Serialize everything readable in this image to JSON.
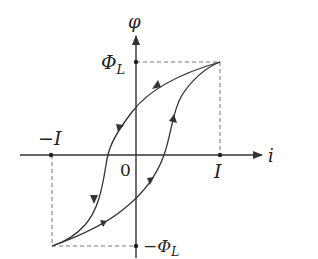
{
  "axes": {
    "x_label": "i",
    "y_label": "φ",
    "origin_label": "0"
  },
  "marks": {
    "phi_L": "Φ",
    "phi_L_sub": "L",
    "neg_phi_L": "−Φ",
    "neg_phi_L_sub": "L",
    "I": "I",
    "neg_I": "−I"
  },
  "colors": {
    "line": "#333333",
    "dashed": "#777777",
    "background": "#ffffff"
  },
  "curves": [
    {
      "name": "descending-branch",
      "direction": "from (I, Φ_L) to (−I, −Φ_L)"
    },
    {
      "name": "ascending-branch",
      "direction": "from (−I, −Φ_L) to (I, Φ_L)"
    }
  ]
}
